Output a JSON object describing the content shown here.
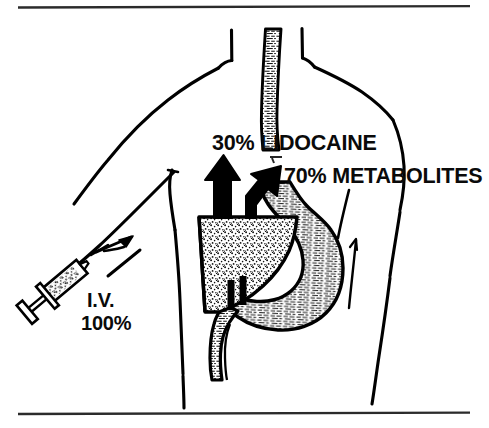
{
  "figure": {
    "domain_kind": "medical-illustration",
    "title_text": null,
    "background_color": "#ffffff",
    "ink_color": "#000000",
    "rules": {
      "top": {
        "y": 7,
        "x_start": 18,
        "x_end": 470,
        "thickness": 2
      },
      "bottom": {
        "y": 413,
        "x_start": 18,
        "x_end": 470,
        "thickness": 2
      }
    },
    "labels": [
      {
        "id": "lidocaine",
        "text": "30% LIDOCAINE",
        "percent": "30%",
        "substance": "LIDOCAINE",
        "x": 212,
        "y": 133
      },
      {
        "id": "metabolites",
        "text": "70% METABOLITES",
        "percent": "70%",
        "substance": "METABOLITES",
        "x": 284,
        "y": 166
      },
      {
        "id": "iv-route",
        "text": "I.V.",
        "x": 87,
        "y": 290
      },
      {
        "id": "iv-dose",
        "text": "100%",
        "x": 81,
        "y": 313
      }
    ],
    "anatomy": [
      {
        "id": "torso",
        "name": "torso-outline",
        "fill": "none"
      },
      {
        "id": "arm",
        "name": "left-arm-outline",
        "fill": "none"
      },
      {
        "id": "esophagus",
        "name": "esophagus",
        "texture": "hatch"
      },
      {
        "id": "stomach",
        "name": "stomach",
        "texture": "hatch"
      },
      {
        "id": "duodenum",
        "name": "duodenum",
        "texture": "hatch"
      },
      {
        "id": "liver",
        "name": "liver",
        "texture": "stipple"
      }
    ],
    "arrows": [
      {
        "id": "arrow-lidocaine",
        "name": "lidocaine-output-arrow",
        "direction": "up",
        "color": "#000000"
      },
      {
        "id": "arrow-metabolites",
        "name": "metabolites-output-arrow",
        "direction": "up-right",
        "color": "#000000"
      },
      {
        "id": "arrow-iv-flow",
        "name": "iv-injection-flow-arrow",
        "direction": "up-right",
        "color": "#000000"
      }
    ],
    "devices": [
      {
        "id": "syringe",
        "name": "syringe",
        "contents_texture": "stipple"
      }
    ]
  }
}
